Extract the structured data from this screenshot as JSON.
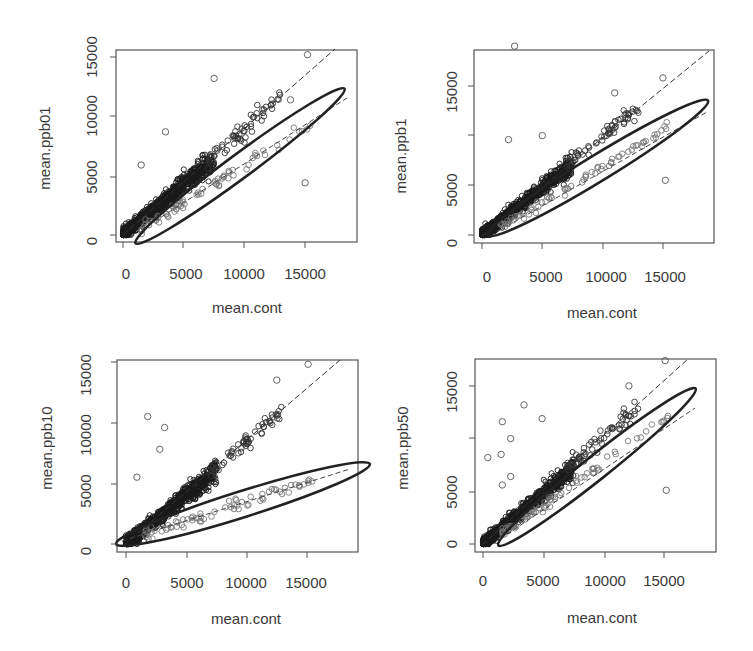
{
  "chart_data": [
    {
      "type": "scatter",
      "panel": "top-left",
      "xlabel": "mean.cont",
      "ylabel": "mean.ppb01",
      "xticks": [
        0,
        5000,
        10000,
        15000
      ],
      "yticks": [
        0,
        5000,
        10000,
        15000
      ],
      "xlim": [
        -500,
        19000
      ],
      "ylim": [
        -300,
        15800
      ],
      "reference_line": {
        "style": "dashed",
        "from": [
          0,
          0
        ],
        "to": [
          17500,
          16000
        ]
      },
      "ellipse": {
        "style": "solid-thick",
        "center": [
          9300,
          5700
        ],
        "major_end": [
          19000,
          12000
        ],
        "note": "elongated ellipse enclosing lower sub-cluster"
      },
      "inner_dashed_line": {
        "from": [
          1500,
          600
        ],
        "to": [
          18500,
          11300
        ]
      },
      "outliers": [
        [
          7500,
          13200
        ],
        [
          3500,
          8700
        ],
        [
          1500,
          5900
        ],
        [
          15000,
          4400
        ],
        [
          15200,
          15200
        ],
        [
          13800,
          11400
        ]
      ]
    },
    {
      "type": "scatter",
      "panel": "top-right",
      "xlabel": "mean.cont",
      "ylabel": "mean.ppb1",
      "xticks": [
        0,
        5000,
        10000,
        15000
      ],
      "yticks": [
        0,
        5000,
        15000
      ],
      "xlim": [
        -500,
        19000
      ],
      "ylim": [
        -500,
        19300
      ],
      "reference_line": {
        "style": "dashed",
        "from": [
          0,
          0
        ],
        "to": [
          18500,
          19000
        ]
      },
      "ellipse": {
        "style": "solid-thick",
        "center": [
          9300,
          6800
        ],
        "major_end": [
          19000,
          14000
        ]
      },
      "inner_dashed_line": {
        "from": [
          1500,
          700
        ],
        "to": [
          18500,
          13200
        ]
      },
      "outliers": [
        [
          2700,
          19000
        ],
        [
          2200,
          9600
        ],
        [
          5000,
          10000
        ],
        [
          15200,
          5500
        ],
        [
          15000,
          15800
        ],
        [
          11000,
          14300
        ]
      ]
    },
    {
      "type": "scatter",
      "panel": "bottom-left",
      "xlabel": "mean.cont",
      "ylabel": "mean.ppb10",
      "xticks": [
        0,
        5000,
        10000,
        15000
      ],
      "yticks": [
        0,
        5000,
        10000,
        15000
      ],
      "xlim": [
        -500,
        19500
      ],
      "ylim": [
        -300,
        15300
      ],
      "reference_line": {
        "style": "dashed",
        "from": [
          0,
          0
        ],
        "to": [
          17500,
          15300
        ]
      },
      "ellipse": {
        "style": "solid-thick",
        "center": [
          9300,
          3600
        ],
        "major_end": [
          19500,
          7000
        ]
      },
      "inner_dashed_line": {
        "from": [
          0,
          300
        ],
        "to": [
          18500,
          6300
        ]
      },
      "outliers": [
        [
          1800,
          10500
        ],
        [
          3200,
          9600
        ],
        [
          2800,
          7800
        ],
        [
          900,
          5500
        ],
        [
          15100,
          14800
        ],
        [
          12500,
          13500
        ]
      ]
    },
    {
      "type": "scatter",
      "panel": "bottom-right",
      "xlabel": "mean.cont",
      "ylabel": "mean.ppb50",
      "xticks": [
        0,
        5000,
        10000,
        15000
      ],
      "yticks": [
        0,
        5000,
        15000
      ],
      "xlim": [
        -500,
        19000
      ],
      "ylim": [
        -500,
        17800
      ],
      "reference_line": {
        "style": "dashed",
        "from": [
          0,
          0
        ],
        "to": [
          17000,
          17800
        ]
      },
      "ellipse": {
        "style": "solid-thick",
        "center": [
          9100,
          7400
        ],
        "major_end": [
          18300,
          15000
        ]
      },
      "inner_dashed_line": {
        "from": [
          1500,
          800
        ],
        "to": [
          17500,
          13800
        ]
      },
      "outliers": [
        [
          3400,
          13200
        ],
        [
          1600,
          11600
        ],
        [
          2300,
          10000
        ],
        [
          400,
          8200
        ],
        [
          1500,
          8500
        ],
        [
          2300,
          6400
        ],
        [
          1600,
          5600
        ],
        [
          15200,
          5100
        ],
        [
          4900,
          11900
        ],
        [
          15100,
          17400
        ],
        [
          12100,
          15000
        ]
      ]
    }
  ],
  "panels": [
    {
      "ylabel": "mean.ppb01",
      "xlabel": "mean.cont",
      "xticks": [
        "0",
        "5000",
        "10000",
        "15000"
      ],
      "yticks": [
        "0",
        "5000",
        "10000",
        "15000"
      ]
    },
    {
      "ylabel": "mean.ppb1",
      "xlabel": "mean.cont",
      "xticks": [
        "0",
        "5000",
        "10000",
        "15000"
      ],
      "yticks": [
        "0",
        "5000",
        "15000"
      ]
    },
    {
      "ylabel": "mean.ppb10",
      "xlabel": "mean.cont",
      "xticks": [
        "0",
        "5000",
        "10000",
        "15000"
      ],
      "yticks": [
        "0",
        "5000",
        "10000",
        "15000"
      ]
    },
    {
      "ylabel": "mean.ppb50",
      "xlabel": "mean.cont",
      "xticks": [
        "0",
        "5000",
        "10000",
        "15000"
      ],
      "yticks": [
        "0",
        "5000",
        "15000"
      ]
    }
  ]
}
